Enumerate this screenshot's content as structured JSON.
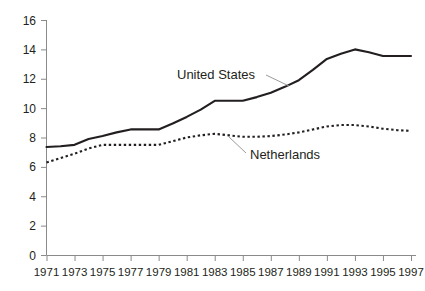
{
  "chart_data": {
    "type": "line",
    "title": "",
    "subtitle": "",
    "xlabel": "",
    "ylabel": "",
    "grid": false,
    "legend_position": "inline-annotations",
    "xlim": [
      1971,
      1997
    ],
    "ylim": [
      0,
      16
    ],
    "y_ticks": [
      0,
      2,
      4,
      6,
      8,
      10,
      12,
      14,
      16
    ],
    "y_tick_labels": [
      "0",
      "2",
      "4",
      "6",
      "8",
      "10",
      "12",
      "14",
      "16"
    ],
    "x": [
      1971,
      1972,
      1973,
      1974,
      1975,
      1976,
      1977,
      1978,
      1979,
      1980,
      1981,
      1982,
      1983,
      1984,
      1985,
      1986,
      1987,
      1988,
      1989,
      1990,
      1991,
      1992,
      1993,
      1994,
      1995,
      1996,
      1997
    ],
    "x_ticks": [
      1971,
      1973,
      1975,
      1977,
      1979,
      1981,
      1983,
      1985,
      1987,
      1989,
      1991,
      1993,
      1995,
      1997
    ],
    "x_tick_labels": [
      "1971",
      "1973",
      "1975",
      "1977",
      "1979",
      "1981",
      "1983",
      "1985",
      "1987",
      "1989",
      "1991",
      "1993",
      "1995",
      "1997"
    ],
    "series": [
      {
        "name": "United States",
        "style": "solid",
        "color": "#231f20",
        "annotation": "United States",
        "values": [
          7.35,
          7.4,
          7.5,
          7.9,
          8.1,
          8.35,
          8.55,
          8.55,
          8.55,
          8.95,
          9.4,
          9.9,
          10.5,
          10.5,
          10.5,
          10.75,
          11.05,
          11.45,
          11.9,
          12.6,
          13.35,
          13.7,
          14.0,
          13.8,
          13.55,
          13.55,
          13.55
        ]
      },
      {
        "name": "Netherlands",
        "style": "dotted",
        "color": "#231f20",
        "annotation": "Netherlands",
        "values": [
          6.3,
          6.6,
          6.9,
          7.25,
          7.5,
          7.5,
          7.5,
          7.5,
          7.5,
          7.75,
          8.0,
          8.15,
          8.25,
          8.15,
          8.05,
          8.05,
          8.1,
          8.2,
          8.35,
          8.55,
          8.75,
          8.85,
          8.85,
          8.75,
          8.6,
          8.5,
          8.45
        ]
      }
    ],
    "annotations": [
      {
        "text": "United States",
        "x_px": 177,
        "y_px": 79,
        "leader_from": [
          266,
          75
        ],
        "leader_to": [
          289,
          86
        ]
      },
      {
        "text": "Netherlands",
        "x_px": 250,
        "y_px": 159,
        "leader_from": [
          246,
          153
        ],
        "leader_to": [
          228,
          136
        ]
      }
    ]
  },
  "axis": {
    "y_axis_name": "y-axis",
    "x_axis_name": "x-axis"
  }
}
